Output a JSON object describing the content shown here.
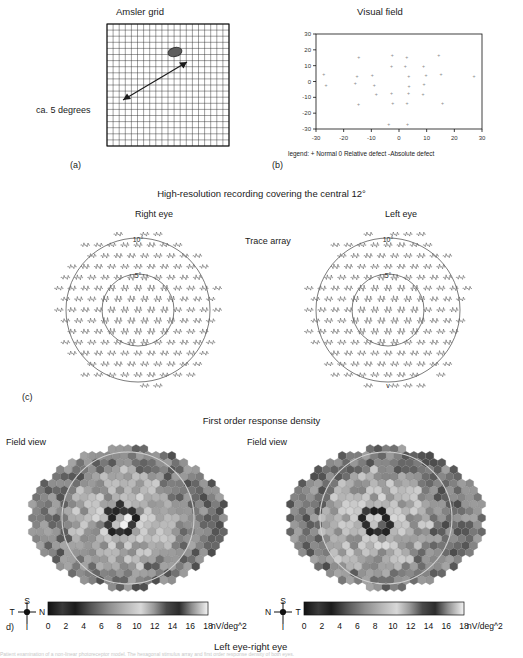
{
  "figure": {
    "panels": {
      "a": "(a)",
      "b": "(b)",
      "c": "(c)",
      "d": "d)"
    },
    "bottom_caption_fragment": "Patient examination of a non-linear photoreceptor model. The hexagonal stimulus array and first order response density of both eyes."
  },
  "panel_a": {
    "title": "Amsler grid",
    "annotation": "ca. 5 degrees",
    "grid_cols": 20,
    "grid_rows": 20,
    "scotoma_color": "#5a5a5a"
  },
  "panel_b": {
    "title": "Visual field",
    "legend": "legend:   + Normal   0 Relative defect   -Absolute defect",
    "xticks": [
      "-30",
      "-20",
      "-10",
      "0",
      "10",
      "20",
      "30"
    ],
    "yticks": [
      "30",
      "20",
      "10",
      "0",
      "-10",
      "-20",
      "-30"
    ],
    "xlim": [
      -30,
      30
    ],
    "ylim": [
      -30,
      30
    ],
    "symbol": "+"
  },
  "panel_c": {
    "title": "High-resolution recording covering the central 12°",
    "center_label": "Trace array",
    "right_eye_label": "Right eye",
    "left_eye_label": "Left eye",
    "ring_labels": [
      "10°",
      "5°"
    ],
    "marker": "v"
  },
  "panel_d": {
    "title": "First order response density",
    "field_view_label": "Field view",
    "footer": "Left eye-right eye",
    "colorbar": {
      "ticks": [
        "0",
        "2",
        "4",
        "6",
        "8",
        "10",
        "12",
        "14",
        "16",
        "18"
      ],
      "unit": "nV/deg^2",
      "min": 0,
      "max": 18
    },
    "orientation_left": {
      "top": "S",
      "left": "T",
      "right": "N",
      "bottom": "I"
    },
    "orientation_right": {
      "top": "S",
      "left": "N",
      "right": "T",
      "bottom": "I"
    }
  },
  "chart_data": {
    "type": "heatmap",
    "title": "First order response density",
    "unit": "nV/deg^2",
    "zlim": [
      0,
      18
    ],
    "colormap": "grayscale-banded",
    "maps": [
      {
        "name": "Right eye field view",
        "peak_center": 17.5,
        "ring_defect": 1.5,
        "periphery": 7.0
      },
      {
        "name": "Left eye field view",
        "peak_center": 16.0,
        "ring_defect": 1.8,
        "periphery": 6.5
      }
    ],
    "visual_field": {
      "type": "scatter",
      "title": "Visual field",
      "xlabel": "",
      "ylabel": "",
      "xlim": [
        -30,
        30
      ],
      "ylim": [
        -30,
        30
      ],
      "xticks": [
        -30,
        -20,
        -10,
        0,
        10,
        20,
        30
      ],
      "yticks": [
        -30,
        -20,
        -10,
        0,
        10,
        20,
        30
      ],
      "grid": false,
      "legend_entries": [
        "+ Normal",
        "0 Relative defect",
        "-Absolute defect"
      ]
    }
  }
}
